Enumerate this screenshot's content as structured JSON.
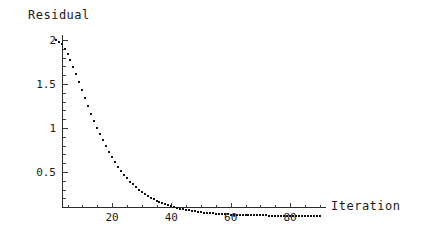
{
  "chart_data": {
    "type": "scatter",
    "title": "",
    "xlabel": "Iteration",
    "ylabel": "Residual",
    "grid": false,
    "legend": null,
    "marker": "square-dot",
    "color": "#111111",
    "xlim": [
      0,
      92
    ],
    "ylim": [
      0,
      2.1
    ],
    "xticks": [
      20,
      40,
      60,
      80
    ],
    "xtick_labels": [
      "20",
      "40",
      "60",
      "80"
    ],
    "xminor_step": 5,
    "yticks": [
      0.5,
      1,
      1.5,
      2
    ],
    "ytick_labels": [
      "0.5",
      "1",
      "1.5",
      "2"
    ],
    "yminor_step": 0.1,
    "series": [
      {
        "name": "residual",
        "x": [
          1,
          2,
          3,
          4,
          5,
          6,
          7,
          8,
          9,
          10,
          11,
          12,
          13,
          14,
          15,
          16,
          17,
          18,
          19,
          20,
          21,
          22,
          23,
          24,
          25,
          26,
          27,
          28,
          29,
          30,
          31,
          32,
          33,
          34,
          35,
          36,
          37,
          38,
          39,
          40,
          41,
          42,
          43,
          44,
          45,
          46,
          47,
          48,
          49,
          50,
          51,
          52,
          53,
          54,
          55,
          56,
          57,
          58,
          59,
          60,
          61,
          62,
          63,
          64,
          65,
          66,
          67,
          68,
          69,
          70,
          71,
          72,
          73,
          74,
          75,
          76,
          77,
          78,
          79,
          80,
          81,
          82,
          83,
          84,
          85,
          86,
          87,
          88,
          89,
          90
        ],
        "y": [
          2.0,
          1.98,
          1.95,
          1.9,
          1.84,
          1.77,
          1.69,
          1.61,
          1.52,
          1.43,
          1.34,
          1.25,
          1.16,
          1.08,
          1.0,
          0.93,
          0.86,
          0.79,
          0.73,
          0.67,
          0.61,
          0.56,
          0.51,
          0.47,
          0.43,
          0.39,
          0.36,
          0.33,
          0.3,
          0.27,
          0.25,
          0.23,
          0.21,
          0.19,
          0.17,
          0.16,
          0.145,
          0.132,
          0.12,
          0.11,
          0.1,
          0.091,
          0.083,
          0.076,
          0.069,
          0.063,
          0.057,
          0.052,
          0.047,
          0.043,
          0.039,
          0.036,
          0.033,
          0.03,
          0.027,
          0.025,
          0.023,
          0.021,
          0.019,
          0.017,
          0.016,
          0.014,
          0.013,
          0.012,
          0.011,
          0.01,
          0.009,
          0.008,
          0.008,
          0.007,
          0.006,
          0.006,
          0.005,
          0.005,
          0.004,
          0.004,
          0.004,
          0.003,
          0.003,
          0.003,
          0.002,
          0.002,
          0.002,
          0.002,
          0.002,
          0.001,
          0.001,
          0.001,
          0.001,
          0.001
        ]
      }
    ]
  },
  "labels": {
    "y_axis_title": "Residual",
    "x_axis_title": "Iteration"
  }
}
